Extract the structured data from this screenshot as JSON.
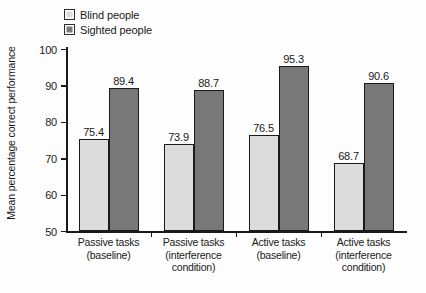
{
  "chart_data": {
    "type": "bar",
    "title": "",
    "xlabel": "",
    "ylabel": "Mean percentage correct performance",
    "ylim": [
      50,
      100
    ],
    "yticks": [
      50,
      60,
      70,
      80,
      90,
      100
    ],
    "ytick_labels": [
      "50",
      "60",
      "70",
      "80",
      "90",
      "100"
    ],
    "grid": false,
    "legend_position": "top-left",
    "categories": [
      "Passive tasks (baseline)",
      "Passive tasks (interference condition)",
      "Active tasks (baseline)",
      "Active tasks (interference condition)"
    ],
    "category_lines": [
      [
        "Passive tasks",
        "(baseline)"
      ],
      [
        "Passive tasks",
        "(interference",
        "condition)"
      ],
      [
        "Active tasks",
        "(baseline)"
      ],
      [
        "Active tasks",
        "(interference",
        "condition)"
      ]
    ],
    "series": [
      {
        "name": "Blind people",
        "color": "#dcdcdc",
        "values": [
          75.4,
          73.9,
          76.5,
          68.7
        ],
        "labels": [
          "75.4",
          "73.9",
          "76.5",
          "68.7"
        ]
      },
      {
        "name": "Sighted people",
        "color": "#787878",
        "values": [
          89.4,
          88.7,
          95.3,
          90.6
        ],
        "labels": [
          "89.4",
          "88.7",
          "95.3",
          "90.6"
        ]
      }
    ]
  },
  "legend": {
    "items": [
      {
        "label": "Blind people",
        "swatch": "light-gray-swatch"
      },
      {
        "label": "Sighted people",
        "swatch": "dark-gray-swatch"
      }
    ]
  },
  "axes": {
    "y_title": "Mean percentage correct performance"
  },
  "colors": {
    "blind": "#dcdcdc",
    "sighted": "#787878",
    "axis": "#1a1a1a",
    "background": "#fdfdfd"
  }
}
